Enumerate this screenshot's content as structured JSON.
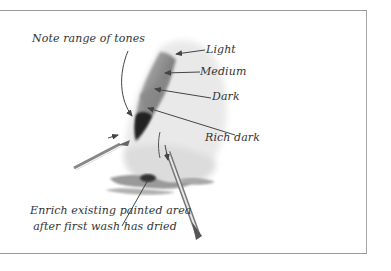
{
  "labels": {
    "note": "Note range of tones",
    "light": "Light",
    "medium": "Medium",
    "dark": "Dark",
    "rich_dark": "Rich dark",
    "caption_line1": "Enrich existing painted area",
    "caption_line2": "after first wash has dried"
  },
  "colors": {
    "frame": "#9a9a9a",
    "text": "#333333",
    "wash_light": "#e6e6e6",
    "wash_medium": "#a8a8a8",
    "wash_dark": "#555555",
    "wash_rich_dark": "#2b2b2b"
  }
}
